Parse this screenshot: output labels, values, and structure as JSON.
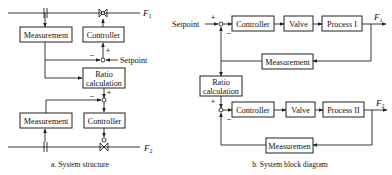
{
  "panel_a": {
    "caption": "a. System structure",
    "flow_top": {
      "symbol": "F",
      "subscript": "1"
    },
    "flow_bottom": {
      "symbol": "F",
      "subscript": "2"
    },
    "blocks": {
      "measurement_top": "Measurement",
      "controller_top": "Controller",
      "ratio_line1": "Ratio",
      "ratio_line2": "calculation",
      "measurement_bottom": "Measurement",
      "controller_bottom": "Controller"
    },
    "setpoint_label": "Setpoint",
    "signs": {
      "top_minus": "–",
      "top_plus": "+",
      "bottom_minus": "–",
      "bottom_plus": "+"
    }
  },
  "panel_b": {
    "caption": "b. System block diagram",
    "setpoint_label": "Setpoint",
    "loop1": {
      "controller": "Controller",
      "valve": "Valve",
      "process": "Process I",
      "measurement": "Measurement",
      "output": {
        "symbol": "F",
        "subscript": "1"
      },
      "sign_plus": "+",
      "sign_minus": "–"
    },
    "ratio_line1": "Ratio",
    "ratio_line2": "calculation",
    "loop2": {
      "controller": "Controller",
      "valve": "Valve",
      "process": "Process II",
      "measurement": "Measuremen",
      "output": {
        "symbol": "F",
        "subscript": "2"
      },
      "sign_plus": "+",
      "sign_minus": "–"
    }
  },
  "colors": {
    "line": "#222222",
    "background": "#ffffff"
  }
}
